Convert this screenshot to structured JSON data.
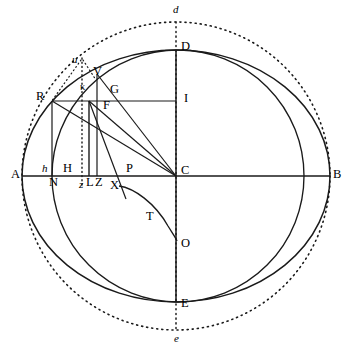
{
  "figure": {
    "canvas": {
      "width": 350,
      "height": 350,
      "background": "#ffffff"
    },
    "ink_color": "#1a1a1a",
    "center": {
      "name": "C",
      "x": 176,
      "y": 176
    }
  },
  "curves": {
    "ellipse": {
      "name": "main-ellipse",
      "cx": 176,
      "cy": 176,
      "rx": 154,
      "ry": 126,
      "stroke": "#1a1a1a",
      "stroke_width": 1.4,
      "style": "solid",
      "endpoints": [
        "A",
        "B",
        "D",
        "E"
      ]
    },
    "dotted_circle": {
      "name": "outer-dotted-circle",
      "cx": 176,
      "cy": 176,
      "r": 154,
      "stroke": "#1a1a1a",
      "stroke_width": 1.5,
      "style": "dotted",
      "dash": "1.2 3.6",
      "endpoints": [
        "d",
        "e"
      ]
    },
    "inner_circle": {
      "name": "inner-circle",
      "cx": 178,
      "cy": 176,
      "r": 126,
      "stroke": "#1a1a1a",
      "stroke_width": 1.4,
      "style": "solid",
      "note": "circle of radius CD passing through D and E"
    },
    "xto_curve": {
      "name": "curve-X-T-O",
      "path": "M 119 186 C 136 189 158 205 170 228 C 174 234 176 237 177 241",
      "stroke": "#1a1a1a",
      "stroke_width": 1.4,
      "style": "solid",
      "through": [
        "X",
        "T",
        "O"
      ]
    }
  },
  "segments": [
    {
      "name": "axis-A-B",
      "x1": 22,
      "y1": 176,
      "x2": 330,
      "y2": 176,
      "style": "solid"
    },
    {
      "name": "axis-D-E",
      "x1": 176,
      "y1": 50,
      "x2": 176,
      "y2": 302,
      "style": "solid"
    },
    {
      "name": "axis-d-e-dotted",
      "x1": 176,
      "y1": 22,
      "x2": 176,
      "y2": 330,
      "style": "dotted"
    },
    {
      "name": "chord-R-I",
      "x1": 52,
      "y1": 101,
      "x2": 176,
      "y2": 101,
      "style": "solid"
    },
    {
      "name": "ordinate-R-N",
      "x1": 52,
      "y1": 101,
      "x2": 52,
      "y2": 176,
      "style": "solid"
    },
    {
      "name": "ordinate-kappa-L",
      "x1": 89,
      "y1": 101,
      "x2": 89,
      "y2": 176,
      "style": "solid"
    },
    {
      "name": "ordinate-V-Z",
      "x1": 97,
      "y1": 73,
      "x2": 97,
      "y2": 176,
      "style": "solid"
    },
    {
      "name": "ordinate-u-z",
      "x1": 82,
      "y1": 60,
      "x2": 82,
      "y2": 186,
      "style": "dotted"
    },
    {
      "name": "radius-C-R",
      "x1": 176,
      "y1": 176,
      "x2": 52,
      "y2": 101,
      "style": "solid"
    },
    {
      "name": "radius-C-kappa",
      "x1": 176,
      "y1": 176,
      "x2": 89,
      "y2": 101,
      "style": "solid"
    },
    {
      "name": "radius-C-V",
      "x1": 176,
      "y1": 176,
      "x2": 97,
      "y2": 73,
      "style": "solid"
    },
    {
      "name": "line-kappa-X",
      "x1": 89,
      "y1": 101,
      "x2": 123,
      "y2": 193,
      "style": "solid"
    },
    {
      "name": "line-u-R",
      "x1": 82,
      "y1": 60,
      "x2": 52,
      "y2": 101,
      "style": "dotted"
    },
    {
      "name": "line-u-kappa",
      "x1": 82,
      "y1": 60,
      "x2": 95,
      "y2": 80,
      "style": "dotted"
    }
  ],
  "labels": [
    {
      "name": "label-A",
      "text": "A",
      "x": 11,
      "y": 170,
      "style": "roman"
    },
    {
      "name": "label-B",
      "text": "B",
      "x": 333,
      "y": 170,
      "style": "roman"
    },
    {
      "name": "label-C",
      "text": "C",
      "x": 181,
      "y": 166,
      "style": "roman"
    },
    {
      "name": "label-D",
      "text": "D",
      "x": 181,
      "y": 42,
      "style": "roman"
    },
    {
      "name": "label-E",
      "text": "E",
      "x": 181,
      "y": 299,
      "style": "roman"
    },
    {
      "name": "label-d",
      "text": "d",
      "x": 173,
      "y": 5,
      "style": "italic"
    },
    {
      "name": "label-e",
      "text": "e",
      "x": 174,
      "y": 334,
      "style": "italic"
    },
    {
      "name": "label-I",
      "text": "I",
      "x": 184,
      "y": 93,
      "style": "roman"
    },
    {
      "name": "label-R",
      "text": "R",
      "x": 37,
      "y": 92,
      "style": "roman"
    },
    {
      "name": "label-V",
      "text": "V",
      "x": 94,
      "y": 68,
      "style": "roman"
    },
    {
      "name": "label-G",
      "text": "G",
      "x": 111,
      "y": 85,
      "style": "roman"
    },
    {
      "name": "label-F",
      "text": "F",
      "x": 104,
      "y": 100,
      "style": "roman"
    },
    {
      "name": "label-kappa",
      "text": "κ",
      "x": 81,
      "y": 83,
      "style": "small"
    },
    {
      "name": "label-u",
      "text": "u",
      "x": 72,
      "y": 55,
      "style": "italic"
    },
    {
      "name": "label-h",
      "text": "h",
      "x": 42,
      "y": 164,
      "style": "italic"
    },
    {
      "name": "label-H",
      "text": "H",
      "x": 64,
      "y": 163,
      "style": "roman"
    },
    {
      "name": "label-N",
      "text": "N",
      "x": 50,
      "y": 177,
      "style": "roman"
    },
    {
      "name": "label-z",
      "text": "z",
      "x": 79,
      "y": 179,
      "style": "italic"
    },
    {
      "name": "label-L",
      "text": "L",
      "x": 87,
      "y": 177,
      "style": "roman"
    },
    {
      "name": "label-Z",
      "text": "Z",
      "x": 95,
      "y": 177,
      "style": "roman"
    },
    {
      "name": "label-X",
      "text": "X",
      "x": 110,
      "y": 180,
      "style": "roman"
    },
    {
      "name": "label-P",
      "text": "P",
      "x": 126,
      "y": 163,
      "style": "roman"
    },
    {
      "name": "label-T",
      "text": "T",
      "x": 146,
      "y": 211,
      "style": "roman"
    },
    {
      "name": "label-O",
      "text": "O",
      "x": 181,
      "y": 239,
      "style": "roman"
    }
  ]
}
